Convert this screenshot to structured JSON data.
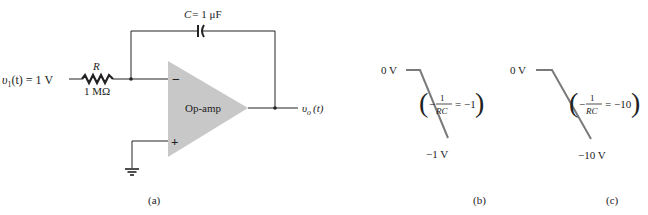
{
  "figure": {
    "panels": [
      {
        "id": "a",
        "caption": "(a)",
        "circuit": {
          "input_label_v": "υ",
          "input_label_sub": "1",
          "input_label_rest": "(t) = 1 V",
          "resistor_symbol": "R",
          "resistor_value": "1 MΩ",
          "capacitor_symbol": "C",
          "capacitor_value": "= 1 μF",
          "opamp_label": "Op-amp",
          "inverting_sign": "−",
          "noninverting_sign": "+",
          "output_label_v": "υ",
          "output_label_sub": "o",
          "output_label_rest": "(t)",
          "components": [
            "resistor",
            "capacitor",
            "op-amp",
            "ground"
          ]
        }
      },
      {
        "id": "b",
        "caption": "(b)",
        "waveform": {
          "start_label": "0 V",
          "end_label": "−1 V",
          "formula_prefix": "−",
          "formula_num": "1",
          "formula_den": "RC",
          "formula_eq": "= −1",
          "slope": -1
        }
      },
      {
        "id": "c",
        "caption": "(c)",
        "waveform": {
          "start_label": "0 V",
          "end_label": "−10 V",
          "formula_prefix": "−",
          "formula_num": "1",
          "formula_den": "RC",
          "formula_eq": "= −10",
          "slope": -10
        }
      }
    ],
    "colors": {
      "wire": "#222222",
      "opamp_fill": "#c8c8c8",
      "ramp_line": "#7a7a7a"
    }
  }
}
